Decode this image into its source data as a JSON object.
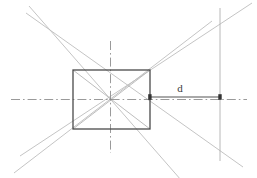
{
  "drawing": {
    "title": "Rectangle with perspective construction lines and distance dimension d",
    "canvas": {
      "width": 257,
      "height": 178,
      "background": "#ffffff"
    },
    "colors": {
      "rectangle_stroke": "#4a4a4a",
      "construction_line": "#b9b9b9",
      "centerline": "#9a9a9a",
      "dimension_line": "#555555",
      "extension_line": "#b0b0b0",
      "label_text": "#3a3a3a"
    },
    "rectangle": {
      "name": "main-rectangle",
      "x": 73,
      "y": 70,
      "width": 77,
      "height": 59,
      "stroke_width": 1.3
    },
    "center_point": {
      "x": 110.5,
      "y": 99.5
    },
    "diagonals": [
      {
        "name": "diagonal-tl-br",
        "x1": 73,
        "y1": 70,
        "x2": 150,
        "y2": 129
      },
      {
        "name": "diagonal-bl-tr",
        "x1": 73,
        "y1": 129,
        "x2": 150,
        "y2": 70
      }
    ],
    "construction_lines": [
      {
        "name": "ray-upper-left",
        "x1": 29,
        "y1": 6,
        "x2": 110.5,
        "y2": 99.5
      },
      {
        "name": "ray-lower-left",
        "x1": 14,
        "y1": 173,
        "x2": 110.5,
        "y2": 99.5
      },
      {
        "name": "ray-upper-right",
        "x1": 252,
        "y1": 3,
        "x2": 110.5,
        "y2": 99.5
      },
      {
        "name": "ray-lower-right",
        "x1": 243,
        "y1": 167,
        "x2": 110.5,
        "y2": 99.5
      }
    ],
    "centerlines": [
      {
        "name": "horizontal-centerline",
        "x1": 11,
        "y1": 99.5,
        "x2": 247,
        "y2": 99.5,
        "orientation": "horizontal"
      },
      {
        "name": "vertical-centerline",
        "x1": 110.5,
        "y1": 41,
        "x2": 110.5,
        "y2": 153,
        "orientation": "vertical"
      }
    ],
    "extension_line": {
      "name": "vertical-extension-line",
      "x": 220,
      "y1": 8,
      "y2": 161
    },
    "dimension": {
      "name": "distance-dimension-d",
      "label": "d",
      "label_x": 180,
      "label_y": 92,
      "line_y": 97,
      "x_start": 150,
      "x_end": 220,
      "arrow_style": "filled-square-ticks"
    }
  }
}
